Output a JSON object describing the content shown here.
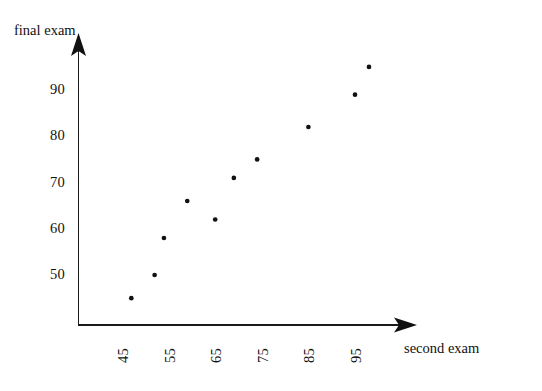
{
  "chart_data": {
    "type": "scatter",
    "title": "",
    "xlabel": "second exam",
    "ylabel": "final exam",
    "xlim": [
      40,
      101
    ],
    "ylim": [
      41,
      98
    ],
    "grid": false,
    "legend": null,
    "x_ticks": [
      "45",
      "55",
      "65",
      "75",
      "85",
      "95"
    ],
    "x_tick_values": [
      45,
      55,
      65,
      75,
      85,
      95
    ],
    "y_ticks": [
      "50",
      "60",
      "70",
      "80",
      "90"
    ],
    "y_tick_values": [
      50,
      60,
      70,
      80,
      90
    ],
    "x": [
      47,
      52,
      54,
      59,
      65,
      69,
      74,
      85,
      95,
      98
    ],
    "y": [
      45,
      50,
      58,
      66,
      62,
      71,
      75,
      82,
      89,
      95
    ],
    "points": [
      {
        "x": 47,
        "y": 45
      },
      {
        "x": 52,
        "y": 50
      },
      {
        "x": 54,
        "y": 58
      },
      {
        "x": 59,
        "y": 66
      },
      {
        "x": 65,
        "y": 62
      },
      {
        "x": 69,
        "y": 71
      },
      {
        "x": 74,
        "y": 75
      },
      {
        "x": 85,
        "y": 82
      },
      {
        "x": 95,
        "y": 89
      },
      {
        "x": 98,
        "y": 95
      }
    ],
    "marker": {
      "shape": "circle",
      "size": 3,
      "color": "#111111"
    },
    "axis_color": "#1a1a1a",
    "background_color": "#ffffff"
  },
  "axes": {
    "y_title": "final exam",
    "x_title": "second exam"
  },
  "icons": {
    "y_axis_arrow": "arrow-up-icon",
    "x_axis_arrow": "arrow-right-icon"
  }
}
